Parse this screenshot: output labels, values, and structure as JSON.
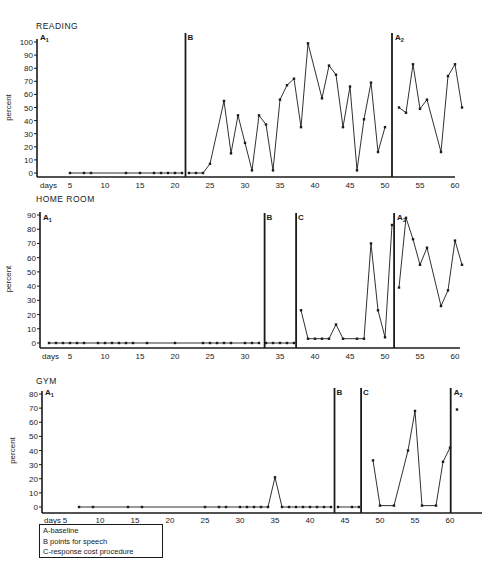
{
  "chart_data": [
    {
      "type": "line",
      "title": "READING",
      "xlabel": "days",
      "ylabel": "percent",
      "ylim": [
        0,
        100
      ],
      "xlim": [
        0,
        62
      ],
      "yticks": [
        0,
        10,
        20,
        30,
        40,
        50,
        60,
        70,
        80,
        90,
        100
      ],
      "xticks": [
        5,
        10,
        15,
        20,
        25,
        30,
        35,
        40,
        45,
        50,
        55,
        60
      ],
      "grid": false,
      "phase_lines": [
        {
          "label": "B",
          "day": 21.5
        },
        {
          "label": "A2",
          "day": 51
        }
      ],
      "phase_start_label": "A1",
      "series": [
        {
          "name": "A1 baseline",
          "x": [
            5,
            7,
            8,
            13,
            15,
            17,
            18,
            19,
            20,
            21
          ],
          "y": [
            0,
            0,
            0,
            0,
            0,
            0,
            0,
            0,
            0,
            0
          ]
        },
        {
          "name": "B points for speech",
          "x": [
            22,
            23,
            24,
            25,
            27,
            28,
            29,
            30,
            31,
            32,
            33,
            34,
            35,
            36,
            37,
            38,
            39,
            41,
            42,
            43,
            44,
            45,
            46,
            47,
            48,
            49,
            50
          ],
          "y": [
            0,
            0,
            0,
            7,
            55,
            15,
            44,
            23,
            2,
            44,
            37,
            2,
            56,
            67,
            72,
            35,
            99,
            57,
            82,
            75,
            35,
            66,
            2,
            41,
            69,
            16,
            35
          ]
        },
        {
          "name": "A2",
          "x": [
            52,
            53,
            54,
            55,
            56,
            58,
            59,
            60,
            61
          ],
          "y": [
            50,
            46,
            83,
            49,
            56,
            16,
            74,
            83,
            50
          ]
        }
      ]
    },
    {
      "type": "line",
      "title": "HOME ROOM",
      "xlabel": "days",
      "ylabel": "percent",
      "ylim": [
        0,
        90
      ],
      "xlim": [
        0,
        62
      ],
      "yticks": [
        0,
        10,
        20,
        30,
        40,
        50,
        60,
        70,
        80,
        90
      ],
      "xticks": [
        5,
        10,
        15,
        20,
        25,
        30,
        35,
        40,
        45,
        50,
        55,
        60
      ],
      "grid": false,
      "phase_lines": [
        {
          "label": "B",
          "day": 32.8
        },
        {
          "label": "C",
          "day": 37.3
        },
        {
          "label": "A2",
          "day": 51.3
        }
      ],
      "phase_start_label": "A1",
      "series": [
        {
          "name": "A1 baseline",
          "x": [
            2,
            3,
            4,
            5,
            6,
            7,
            9,
            10,
            11,
            12,
            13,
            14,
            16,
            20,
            24,
            25,
            26,
            27,
            28,
            30,
            31,
            32
          ],
          "y": [
            0,
            0,
            0,
            0,
            0,
            0,
            0,
            0,
            0,
            0,
            0,
            0,
            0,
            0,
            0,
            0,
            0,
            0,
            0,
            0,
            0,
            0
          ]
        },
        {
          "name": "B points for speech",
          "x": [
            33,
            34,
            35,
            36,
            37
          ],
          "y": [
            0,
            0,
            0,
            0,
            0
          ]
        },
        {
          "name": "C response cost procedure",
          "x": [
            38,
            39,
            40,
            41,
            42,
            43,
            44,
            46,
            47,
            48,
            49,
            50,
            51
          ],
          "y": [
            23,
            3,
            3,
            3,
            3,
            13,
            3,
            3,
            3,
            70,
            23,
            4,
            83
          ]
        },
        {
          "name": "A2",
          "x": [
            52,
            53,
            54,
            55,
            56,
            58,
            59,
            60,
            61
          ],
          "y": [
            39,
            88,
            73,
            55,
            67,
            26,
            37,
            72,
            55
          ]
        }
      ]
    },
    {
      "type": "line",
      "title": "GYM",
      "xlabel": "days",
      "ylabel": "percent",
      "ylim": [
        0,
        85
      ],
      "xlim": [
        0,
        62
      ],
      "yticks": [
        0,
        10,
        20,
        30,
        40,
        50,
        60,
        70,
        80
      ],
      "xticks": [
        5,
        10,
        15,
        20,
        25,
        30,
        35,
        40,
        45,
        50,
        55,
        60
      ],
      "grid": false,
      "phase_lines": [
        {
          "label": "B",
          "day": 43.5
        },
        {
          "label": "C",
          "day": 47.3
        },
        {
          "label": "A2",
          "day": 60.1
        }
      ],
      "phase_start_label": "A1",
      "series": [
        {
          "name": "A1 baseline",
          "x": [
            7,
            9,
            14,
            16,
            25,
            27,
            28,
            30,
            31,
            32,
            33,
            34,
            35,
            36,
            37,
            38,
            39,
            40,
            41,
            42,
            43
          ],
          "y": [
            0,
            0,
            0,
            0,
            0,
            0,
            0,
            0,
            0,
            0,
            0,
            0,
            21,
            0,
            0,
            0,
            0,
            0,
            0,
            0,
            0
          ]
        },
        {
          "name": "B points for speech",
          "x": [
            44,
            46,
            47
          ],
          "y": [
            0,
            0,
            0
          ]
        },
        {
          "name": "C response cost procedure",
          "x": [
            49,
            50,
            52,
            54,
            55,
            56,
            58,
            59,
            60
          ],
          "y": [
            33,
            1,
            1,
            40,
            68,
            1,
            1,
            32,
            42
          ]
        },
        {
          "name": "A2",
          "x": [
            61
          ],
          "y": [
            69
          ]
        }
      ]
    }
  ],
  "labels": {
    "days": "days",
    "percent": "percent",
    "reading_title": "READING",
    "homeroom_title": "HOME ROOM",
    "gym_title": "GYM",
    "phase_a1": "A",
    "phase_a1_sub": "1",
    "phase_a2": "A",
    "phase_a2_sub": "2",
    "phase_b": "B",
    "phase_c": "C"
  },
  "legend": {
    "items": [
      "A-baseline",
      "B points for speech",
      "C-response cost procedure"
    ]
  },
  "colors": {
    "ink": "#1a1a1a",
    "background": "#ffffff"
  }
}
